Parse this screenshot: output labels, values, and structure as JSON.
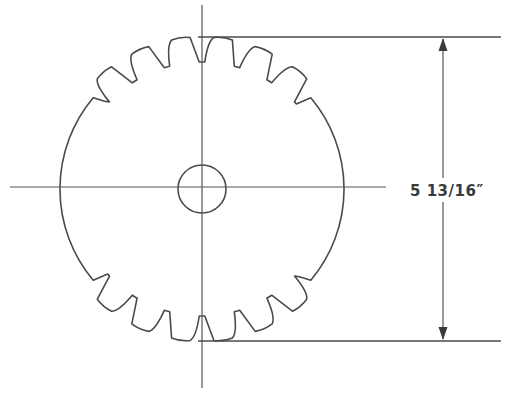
{
  "figure": {
    "title": "",
    "dimension": {
      "label": "5 13/16″",
      "measures": "distance between top and bottom tooth extension lines"
    },
    "colors": {
      "line": "#4a4a4a",
      "background": "#ffffff"
    }
  },
  "geometry": {
    "center": [
      202,
      189
    ],
    "hole_radius": 24,
    "body_radius": 142,
    "tip_radius": 152,
    "root_radius": 127,
    "teeth_per_side": 6,
    "teeth_angle_start_deg": -48,
    "teeth_angle_end_deg": 48,
    "centerline_vertical": {
      "x": 202,
      "y1": 5,
      "y2": 388
    },
    "centerline_horizontal": {
      "y": 187,
      "x1": 10,
      "x2": 386
    },
    "extension_top": {
      "y": 37,
      "x1": 198,
      "x2": 501
    },
    "extension_bottom": {
      "y": 341,
      "x1": 198,
      "x2": 501
    },
    "dimension_line_x": 443
  }
}
